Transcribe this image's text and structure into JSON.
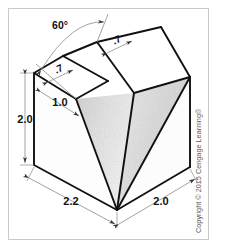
{
  "figure": {
    "object_name": "v-block",
    "background_color": "#ffffff",
    "frame_color": "#c8c8c8",
    "outline_color": "#111111",
    "dimension_line_color": "#8a8a8a",
    "shade_light": "#f2f2f2",
    "shade_mid": "#dcdcdc",
    "shade_dark": "#c9c9c9"
  },
  "dimensions": {
    "angle": {
      "label": "60°",
      "value": 60,
      "unit": "degrees",
      "name": "v-groove-included-angle"
    },
    "top_left_width": {
      "label": ".7",
      "value": 0.7,
      "name": "top-left-land-width"
    },
    "top_right_width": {
      "label": ".7",
      "value": 0.7,
      "name": "top-right-land-width"
    },
    "height": {
      "label": "2.0",
      "value": 2.0,
      "name": "overall-height"
    },
    "groove_depth": {
      "label": "1.0",
      "value": 1.0,
      "name": "groove-depth"
    },
    "front_width": {
      "label": "2.2",
      "value": 2.2,
      "name": "front-face-width"
    },
    "side_depth": {
      "label": "2.0",
      "value": 2.0,
      "name": "side-face-depth"
    }
  },
  "copyright": {
    "text": "Copyright © 2015 Cengage Learning®",
    "year": "2015",
    "holder": "Cengage Learning®"
  }
}
